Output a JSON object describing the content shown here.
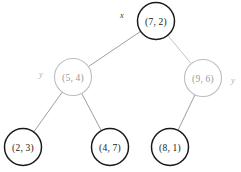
{
  "diagram": {
    "kind": "kd-tree",
    "background_color": "#ffffff"
  },
  "chart_data": {
    "type": "diagram",
    "title": "",
    "nodes": [
      {
        "id": "root",
        "label": "(7, 2)",
        "axis": "x",
        "axis_side": "left",
        "cx": 156,
        "cy": 21,
        "r": 18.5,
        "style": "dark"
      },
      {
        "id": "left",
        "label": "(5, 4)",
        "axis": "y",
        "axis_side": "left",
        "cx": 73,
        "cy": 77,
        "r": 18.5,
        "style": "light"
      },
      {
        "id": "right",
        "label": "(9, 6)",
        "axis": "y",
        "axis_side": "right",
        "cx": 203,
        "cy": 78,
        "r": 18.5,
        "style": "light"
      },
      {
        "id": "ll",
        "label": "(2, 3)",
        "axis": "",
        "axis_side": "",
        "cx": 23,
        "cy": 147,
        "r": 18.5,
        "style": "dark"
      },
      {
        "id": "lr",
        "label": "(4, 7)",
        "axis": "",
        "axis_side": "",
        "cx": 110,
        "cy": 147,
        "r": 18.5,
        "style": "dark"
      },
      {
        "id": "rl",
        "label": "(8, 1)",
        "axis": "",
        "axis_side": "",
        "cx": 170,
        "cy": 147,
        "r": 18.5,
        "style": "dark"
      }
    ],
    "edges": [
      {
        "from": "root",
        "to": "left",
        "style": "normal"
      },
      {
        "from": "root",
        "to": "right",
        "style": "faint"
      },
      {
        "from": "left",
        "to": "ll",
        "style": "normal"
      },
      {
        "from": "left",
        "to": "lr",
        "style": "normal"
      },
      {
        "from": "right",
        "to": "rl",
        "style": "normal"
      }
    ],
    "axis_labels": [
      {
        "for": "root",
        "text": "x",
        "x": 122,
        "y": 15,
        "style": "dark"
      },
      {
        "for": "left",
        "text": "y",
        "x": 41,
        "y": 74,
        "style": "light"
      },
      {
        "for": "right",
        "text": "y",
        "x": 233,
        "y": 80,
        "style": "light"
      }
    ],
    "colors": {
      "node_stroke_dark": "#1a1a1a",
      "node_stroke_light": "#bdbdbd",
      "node_fill": "#ffffff",
      "edge": "#8d8d8d",
      "edge_faint": "#b9b9b9",
      "label_dark": "#1a1a1a",
      "label_light": "#9a9a9a"
    }
  }
}
